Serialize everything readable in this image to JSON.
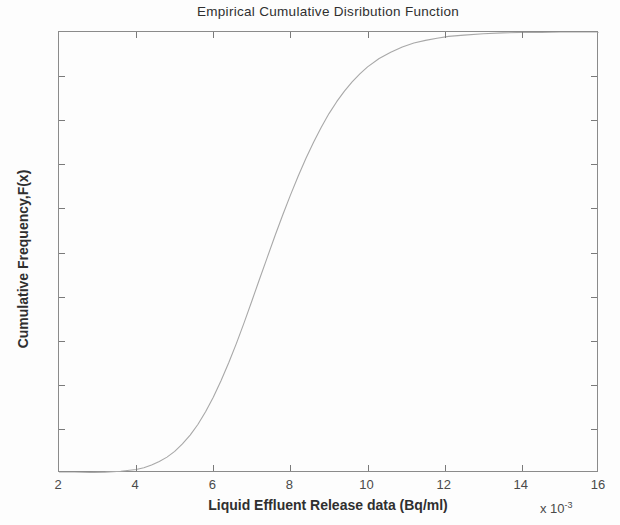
{
  "figure": {
    "background_color": "#fdfdfd",
    "axis_color": "#8b8b8b",
    "line_color": "#a8a8a8"
  },
  "chart_data": {
    "type": "line",
    "title": "Empirical Cumulative Disribution Function",
    "xlabel": "Liquid Effluent Release data (Bq/ml)",
    "ylabel": "Cumulative Frequency,F(x)",
    "x_exponent_label": "x 10",
    "x_exponent_power": "-3",
    "xlim": [
      2,
      16
    ],
    "ylim": [
      0,
      1
    ],
    "grid": false,
    "legend": null,
    "xticks": [
      2,
      4,
      6,
      8,
      10,
      12,
      14,
      16
    ],
    "xtick_labels": [
      "2",
      "4",
      "6",
      "8",
      "10",
      "12",
      "14",
      "16"
    ],
    "yticks": [
      0,
      0.1,
      0.2,
      0.3,
      0.4,
      0.5,
      0.6,
      0.7,
      0.8,
      0.9,
      1
    ],
    "ytick_labels": [
      "0",
      "0.1",
      "0.2",
      "0.3",
      "0.4",
      "0.5",
      "0.6",
      "0.7",
      "0.8",
      "0.9",
      "1"
    ],
    "series": [
      {
        "name": "Empirical CDF",
        "x": [
          2.0,
          2.4,
          2.8,
          3.2,
          3.6,
          4.0,
          4.2,
          4.4,
          4.6,
          4.8,
          5.0,
          5.2,
          5.4,
          5.6,
          5.8,
          6.0,
          6.2,
          6.4,
          6.6,
          6.8,
          7.0,
          7.2,
          7.4,
          7.6,
          7.8,
          8.0,
          8.2,
          8.4,
          8.6,
          8.8,
          9.0,
          9.2,
          9.4,
          9.6,
          9.8,
          10.0,
          10.3,
          10.6,
          10.9,
          11.2,
          11.5,
          11.8,
          12.1,
          12.5,
          13.0,
          13.5,
          14.0,
          14.5,
          15.0,
          15.5,
          16.0
        ],
        "y": [
          0.0,
          0.0,
          0.001,
          0.002,
          0.004,
          0.008,
          0.012,
          0.018,
          0.026,
          0.036,
          0.049,
          0.066,
          0.086,
          0.11,
          0.139,
          0.172,
          0.209,
          0.25,
          0.294,
          0.341,
          0.39,
          0.44,
          0.489,
          0.538,
          0.585,
          0.63,
          0.673,
          0.713,
          0.75,
          0.784,
          0.815,
          0.842,
          0.866,
          0.887,
          0.905,
          0.921,
          0.94,
          0.954,
          0.966,
          0.975,
          0.981,
          0.986,
          0.99,
          0.993,
          0.996,
          0.998,
          0.999,
          0.999,
          1.0,
          1.0,
          1.0
        ]
      }
    ]
  }
}
